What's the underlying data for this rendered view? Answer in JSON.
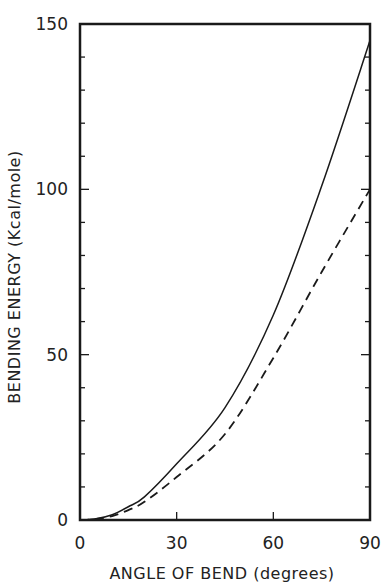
{
  "chart_data": {
    "type": "line",
    "title": "",
    "xlabel": "ANGLE OF BEND (degrees)",
    "ylabel": "BENDING ENERGY (Kcal/mole)",
    "xlim": [
      0,
      90
    ],
    "ylim": [
      0,
      150
    ],
    "x_ticks": [
      0,
      30,
      60,
      90
    ],
    "y_ticks": [
      0,
      50,
      100,
      150
    ],
    "grid": false,
    "legend": null,
    "x": [
      0,
      5,
      10,
      15,
      20,
      30,
      45,
      60,
      75,
      90
    ],
    "series": [
      {
        "name": "solid curve",
        "style": "solid",
        "values": [
          0,
          0.4,
          1.6,
          4,
          7,
          17,
          34,
          62,
          101,
          145
        ]
      },
      {
        "name": "dashed curve",
        "style": "dashed",
        "values": [
          0,
          0.3,
          1.2,
          3,
          5.5,
          13,
          26,
          49,
          75,
          100
        ]
      }
    ]
  },
  "axes": {
    "x_tick_labels": [
      "0",
      "30",
      "60",
      "90"
    ],
    "y_tick_labels": [
      "0",
      "50",
      "100",
      "150"
    ]
  }
}
